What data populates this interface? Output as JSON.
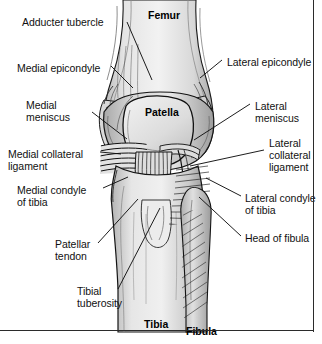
{
  "figure": {
    "colors": {
      "background": "#ffffff",
      "ink": "#111111",
      "bone_light": "#e9e9e9",
      "bone_mid": "#cfcfcf",
      "bone_shadow": "#9a9a9a",
      "outline": "#1a1a1a",
      "frame": "#2b2b2b"
    }
  },
  "bone_labels": [
    {
      "id": "femur",
      "text": "Femur",
      "x": 148,
      "y": 9
    },
    {
      "id": "patella",
      "text": "Patella",
      "x": 145,
      "y": 106
    },
    {
      "id": "tibia",
      "text": "Tibia",
      "x": 144,
      "y": 318
    },
    {
      "id": "fibula",
      "text": "Fibula",
      "x": 186,
      "y": 325
    }
  ],
  "left_labels": [
    {
      "id": "adducter-tubercle",
      "lines": [
        "Adducter tubercle"
      ],
      "x": 22,
      "y": 16
    },
    {
      "id": "medial-epicondyle",
      "lines": [
        "Medial epicondyle"
      ],
      "x": 17,
      "y": 62
    },
    {
      "id": "medial-meniscus",
      "lines": [
        "Medial",
        "meniscus"
      ],
      "x": 26,
      "y": 99
    },
    {
      "id": "medial-collateral-ligament",
      "lines": [
        "Medial collateral",
        "ligament"
      ],
      "x": 8,
      "y": 148
    },
    {
      "id": "medial-condyle-of-tibia",
      "lines": [
        "Medial condyle",
        "of tibia"
      ],
      "x": 17,
      "y": 184
    },
    {
      "id": "patellar-tendon",
      "lines": [
        "Patellar",
        "tendon"
      ],
      "x": 55,
      "y": 238
    },
    {
      "id": "tibial-tuberosity",
      "lines": [
        "Tibial",
        "tuberosity"
      ],
      "x": 77,
      "y": 285
    }
  ],
  "right_labels": [
    {
      "id": "lateral-epicondyle",
      "lines": [
        "Lateral epicondyle"
      ],
      "x": 227,
      "y": 56
    },
    {
      "id": "lateral-meniscus",
      "lines": [
        "Lateral",
        "meniscus"
      ],
      "x": 255,
      "y": 100
    },
    {
      "id": "lateral-collateral-ligament",
      "lines": [
        "Lateral",
        "collateral",
        "ligament"
      ],
      "x": 269,
      "y": 137
    },
    {
      "id": "lateral-condyle-of-tibia",
      "lines": [
        "Lateral condyle",
        "of tibia"
      ],
      "x": 245,
      "y": 192
    },
    {
      "id": "head-of-fibula",
      "lines": [
        "Head of fibula"
      ],
      "x": 245,
      "y": 232
    }
  ],
  "leader_lines": [
    {
      "id": "leader-adducter-tubercle",
      "points": "127,22 152,80"
    },
    {
      "id": "leader-medial-epicondyle",
      "points": "111,66 133,88"
    },
    {
      "id": "leader-medial-meniscus",
      "points": "92,112 127,139"
    },
    {
      "id": "leader-medial-collateral-ligament",
      "points": "100,152 121,154"
    },
    {
      "id": "leader-medial-condyle-of-tibia",
      "points": "103,188 128,177"
    },
    {
      "id": "leader-patellar-tendon",
      "points": "98,243 138,199"
    },
    {
      "id": "leader-tibial-tuberosity",
      "points": "118,289 160,208"
    },
    {
      "id": "leader-lateral-epicondyle",
      "points": "222,60 200,78"
    },
    {
      "id": "leader-lateral-meniscus",
      "points": "250,104 194,140"
    },
    {
      "id": "leader-lateral-collateral-ligament",
      "points": "264,150 190,166"
    },
    {
      "id": "leader-lateral-condyle-of-tibia",
      "points": "241,196 206,178"
    },
    {
      "id": "leader-head-of-fibula",
      "points": "241,236 199,197"
    }
  ]
}
